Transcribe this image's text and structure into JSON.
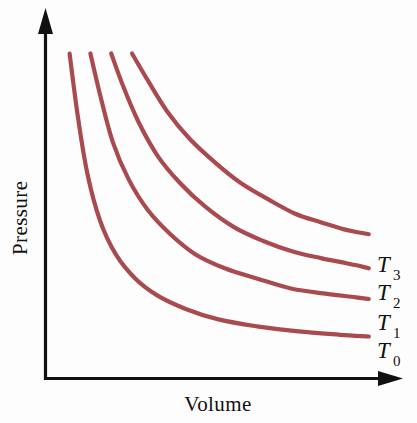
{
  "figure": {
    "title": "",
    "background_color": "#fdfdfd",
    "axis_color": "#111111",
    "curve_color": "#a94a4f"
  },
  "axes": {
    "y_label": "Pressure",
    "x_label": "Volume",
    "y_arrow_icon": "arrow-up-icon",
    "x_arrow_icon": "arrow-right-icon"
  },
  "chart_data": {
    "type": "line",
    "title": "",
    "xlabel": "Volume",
    "ylabel": "Pressure",
    "xlim": [
      0,
      10
    ],
    "ylim": [
      0,
      10
    ],
    "grid": false,
    "legend_position": "right-of-curve-ends",
    "axis_ticks": false,
    "tick_labels": [],
    "annotations": [
      "Four isotherms of an ideal gas; temperature increases from T0 (lowest) to T3 (highest)."
    ],
    "series": [
      {
        "name": "T_0",
        "label_main": "T",
        "label_sub": "0",
        "color": "#a94a4f",
        "constant_k": 11.2,
        "x": [
          0.55,
          0.8,
          1.1,
          1.5,
          2.0,
          2.6,
          3.3,
          4.2,
          5.2,
          6.4,
          7.7,
          9.0,
          9.9
        ],
        "y": [
          9.4,
          7.6,
          5.9,
          4.5,
          3.5,
          2.8,
          2.3,
          1.9,
          1.6,
          1.4,
          1.25,
          1.15,
          1.1
        ],
        "label_point": [
          10.05,
          1.05
        ]
      },
      {
        "name": "T_1",
        "label_main": "T",
        "label_sub": "1",
        "color": "#a94a4f",
        "constant_k": 19.5,
        "x": [
          1.2,
          1.5,
          1.9,
          2.4,
          3.0,
          3.7,
          4.5,
          5.4,
          6.4,
          7.5,
          8.6,
          9.5,
          9.9
        ],
        "y": [
          9.4,
          8.2,
          6.8,
          5.7,
          4.8,
          4.1,
          3.5,
          3.1,
          2.8,
          2.5,
          2.35,
          2.25,
          2.2
        ],
        "label_point": [
          10.05,
          2.15
        ]
      },
      {
        "name": "T_2",
        "label_main": "T",
        "label_sub": "2",
        "color": "#a94a4f",
        "constant_k": 27.5,
        "x": [
          1.85,
          2.2,
          2.7,
          3.3,
          4.0,
          4.8,
          5.7,
          6.6,
          7.5,
          8.4,
          9.2,
          9.7,
          9.9
        ],
        "y": [
          9.4,
          8.5,
          7.4,
          6.4,
          5.6,
          4.9,
          4.3,
          3.9,
          3.6,
          3.4,
          3.25,
          3.15,
          3.1
        ],
        "label_point": [
          10.05,
          3.05
        ]
      },
      {
        "name": "T_3",
        "label_main": "T",
        "label_sub": "3",
        "color": "#a94a4f",
        "constant_k": 36.0,
        "x": [
          2.5,
          3.0,
          3.6,
          4.3,
          5.1,
          5.9,
          6.8,
          7.6,
          8.4,
          9.1,
          9.6,
          9.9
        ],
        "y": [
          9.4,
          8.6,
          7.7,
          6.9,
          6.2,
          5.6,
          5.1,
          4.7,
          4.45,
          4.25,
          4.15,
          4.1
        ],
        "label_point": [
          10.05,
          4.05
        ]
      }
    ]
  },
  "curve_labels": [
    {
      "main": "T",
      "sub": "3"
    },
    {
      "main": "T",
      "sub": "2"
    },
    {
      "main": "T",
      "sub": "1"
    },
    {
      "main": "T",
      "sub": "0"
    }
  ]
}
